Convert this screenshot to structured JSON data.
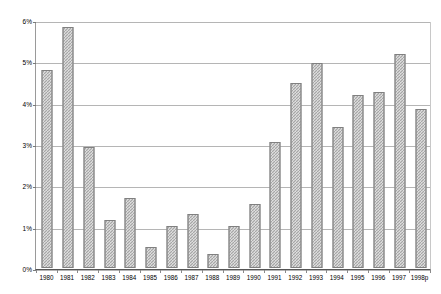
{
  "chart_data": {
    "type": "bar",
    "title": "",
    "subtitle": "",
    "xlabel": "",
    "ylabel": "(% of GDP)",
    "ylim": [
      0,
      6
    ],
    "ytick_labels": [
      "0%",
      "1%",
      "2%",
      "3%",
      "4%",
      "5%",
      "6%"
    ],
    "ytick_values": [
      0,
      1,
      2,
      3,
      4,
      5,
      6
    ],
    "grid": true,
    "legend": false,
    "legend_position": "none",
    "categories": [
      "1980",
      "1981",
      "1982",
      "1983",
      "1984",
      "1985",
      "1986",
      "1987",
      "1988",
      "1989",
      "1990",
      "1991",
      "1992",
      "1993",
      "1994",
      "1995",
      "1996",
      "1997",
      "1998p"
    ],
    "values": [
      4.79,
      5.83,
      2.92,
      1.15,
      1.7,
      0.5,
      1.02,
      1.3,
      0.33,
      1.01,
      1.55,
      3.05,
      4.47,
      4.95,
      3.4,
      4.18,
      4.25,
      5.18,
      3.85
    ],
    "series": [
      {
        "name": "",
        "values": [
          4.79,
          5.83,
          2.92,
          1.15,
          1.7,
          0.5,
          1.02,
          1.3,
          0.33,
          1.01,
          1.55,
          3.05,
          4.47,
          4.95,
          3.4,
          4.18,
          4.25,
          5.18,
          3.85
        ]
      }
    ],
    "annotations": [],
    "colors": {
      "bar_fill": "#a6a6a6",
      "bar_pattern": "#f2f2f2",
      "bar_border": "#808080",
      "gridline": "#b5b5b5",
      "axis": "#555555",
      "text": "#000000",
      "plot_background": "#ffffff"
    }
  }
}
